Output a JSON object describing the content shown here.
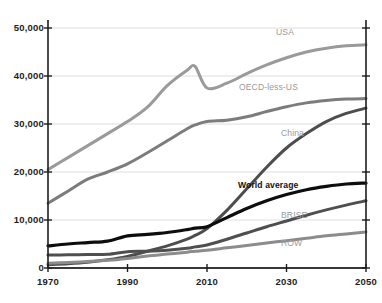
{
  "chart_data": {
    "type": "line",
    "title": "",
    "xlabel": "",
    "ylabel": "",
    "xlim": [
      1970,
      2050
    ],
    "ylim": [
      0,
      50000
    ],
    "grid": true,
    "legend_position": "inline-labels",
    "xticks": [
      "1970",
      "1990",
      "2010",
      "2030",
      "2050"
    ],
    "xtick_values": [
      1970,
      1990,
      2010,
      2030,
      2050
    ],
    "yticks": [
      "0",
      "10,000",
      "20,000",
      "30,000",
      "40,000",
      "50,000"
    ],
    "ytick_values": [
      0,
      10000,
      20000,
      30000,
      40000,
      50000
    ],
    "x": [
      1970,
      1975,
      1980,
      1985,
      1990,
      1995,
      2000,
      2005,
      2007,
      2010,
      2015,
      2020,
      2025,
      2030,
      2035,
      2040,
      2045,
      2050
    ],
    "series": [
      {
        "name": "USA",
        "color": "#9a9a9a",
        "width": 3,
        "label_x": 276,
        "label_y": 28,
        "values": [
          20500,
          23000,
          25500,
          28000,
          30500,
          33500,
          38000,
          41200,
          42000,
          37500,
          38500,
          40500,
          42300,
          43800,
          45000,
          45800,
          46300,
          46500
        ]
      },
      {
        "name": "OECD-less-US",
        "color": "#7c7c7c",
        "width": 3,
        "label_x": 281,
        "label_y": 83,
        "values": [
          13500,
          16000,
          18500,
          20000,
          21700,
          24000,
          26500,
          29000,
          29800,
          30500,
          30800,
          31500,
          32600,
          33600,
          34400,
          34900,
          35200,
          35300
        ]
      },
      {
        "name": "China",
        "color": "#4d4d4d",
        "width": 3,
        "label_x": 281,
        "label_y": 129,
        "values": [
          700,
          900,
          1200,
          1700,
          2400,
          3500,
          4600,
          6000,
          6800,
          8200,
          12000,
          16500,
          21000,
          25000,
          28000,
          30500,
          32200,
          33300
        ]
      },
      {
        "name": "World average",
        "color": "#0d0d0d",
        "width": 3.2,
        "label_x": 280,
        "label_y": 181,
        "values": [
          4600,
          5000,
          5300,
          5600,
          6700,
          7000,
          7400,
          8000,
          8300,
          8600,
          10500,
          12400,
          14000,
          15300,
          16300,
          17000,
          17500,
          17700
        ]
      },
      {
        "name": "BRISE",
        "color": "#4f4f4f",
        "width": 3,
        "label_x": 281,
        "label_y": 211,
        "values": [
          2700,
          2750,
          2800,
          2850,
          3400,
          3500,
          3700,
          4100,
          4400,
          4800,
          6000,
          7300,
          8600,
          9800,
          11000,
          12100,
          13100,
          14000
        ]
      },
      {
        "name": "ROW",
        "color": "#8c8c8c",
        "width": 3,
        "label_x": 281,
        "label_y": 239,
        "values": [
          1000,
          1150,
          1350,
          1600,
          2000,
          2500,
          2900,
          3300,
          3500,
          3700,
          4200,
          4700,
          5200,
          5700,
          6200,
          6700,
          7100,
          7500
        ]
      }
    ],
    "axis_color": "#1d1d1d",
    "grid_color": "#dedede"
  }
}
